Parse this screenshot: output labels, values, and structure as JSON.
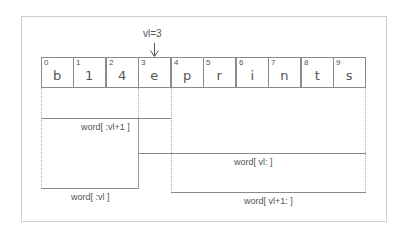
{
  "pointer": {
    "label": "vl=3",
    "target_index": 3
  },
  "cells": [
    {
      "index": "0",
      "char": "b"
    },
    {
      "index": "1",
      "char": "1"
    },
    {
      "index": "2",
      "char": "4"
    },
    {
      "index": "3",
      "char": "e"
    },
    {
      "index": "4",
      "char": "p"
    },
    {
      "index": "5",
      "char": "r"
    },
    {
      "index": "6",
      "char": "i"
    },
    {
      "index": "7",
      "char": "n"
    },
    {
      "index": "8",
      "char": "t"
    },
    {
      "index": "9",
      "char": "s"
    }
  ],
  "slices": {
    "upto_vl_plus_1": "word[ :vl+1 ]",
    "upto_vl": "word[ :vl ]",
    "from_vl": "word[ vl: ]",
    "from_vl_plus_1": "word[ vl+1: ]"
  },
  "colors": {
    "line": "#8a8a8a",
    "frame": "#cfcfcf",
    "text": "#555555"
  }
}
